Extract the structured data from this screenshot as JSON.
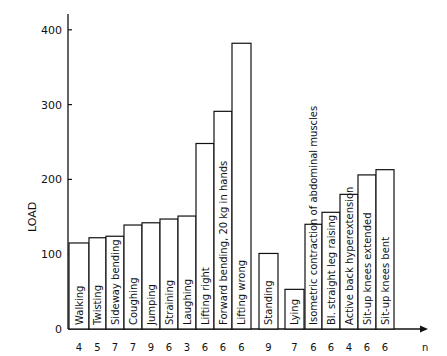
{
  "chart_data": {
    "type": "bar",
    "title": "",
    "xlabel": "n",
    "ylabel": "LOAD",
    "ylim": [
      0,
      400
    ],
    "yticks": [
      0,
      100,
      200,
      300,
      400
    ],
    "grid": false,
    "legend": null,
    "categories": [
      "Walking",
      "Twisting",
      "Sideway bending",
      "Coughing",
      "Jumping",
      "Straining",
      "Laughing",
      "Lifting right",
      "Forward bending, 20 kg in hands",
      "Lifting wrong",
      "Standing",
      "Lying",
      "Isometric contraction of abdominal muscles",
      "Bl. straight leg raising",
      "Active back hyperextension",
      "Sit-up knees extended",
      "Sit-up knees bent"
    ],
    "values": [
      115,
      122,
      124,
      139,
      142,
      147,
      151,
      248,
      291,
      382,
      101,
      53,
      140,
      156,
      180,
      206,
      213
    ],
    "n": [
      4,
      5,
      7,
      7,
      9,
      6,
      3,
      6,
      6,
      6,
      9,
      7,
      6,
      6,
      4,
      6,
      6
    ]
  },
  "axis": {
    "y_label": "LOAD",
    "x_label": "n",
    "y_ticks": [
      "0",
      "100",
      "200",
      "300",
      "400"
    ]
  }
}
